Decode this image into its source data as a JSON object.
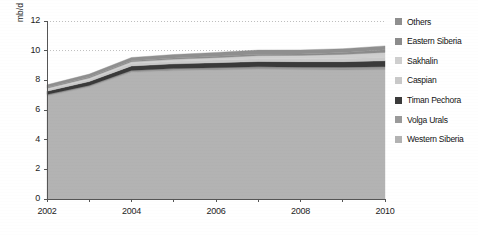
{
  "chart_data": {
    "type": "area",
    "stacked": true,
    "title": "",
    "xlabel": "",
    "ylabel": "mb/d",
    "x": [
      2002,
      2003,
      2004,
      2005,
      2006,
      2007,
      2008,
      2009,
      2010
    ],
    "xtick_labels": [
      "2002",
      "2004",
      "2006",
      "2008",
      "2010"
    ],
    "xtick_values": [
      2002,
      2004,
      2006,
      2008,
      2010
    ],
    "xlim": [
      2002,
      2010
    ],
    "ytick_labels": [
      "0",
      "2",
      "4",
      "6",
      "8",
      "10",
      "12"
    ],
    "ytick_values": [
      0,
      2,
      4,
      6,
      8,
      10,
      12
    ],
    "ylim": [
      0,
      12
    ],
    "grid": "horizontal-dotted",
    "gridlines_at": [
      10,
      12
    ],
    "legend_position": "right",
    "series": [
      {
        "name": "Western Siberia",
        "color": "#b3b3b3",
        "values": [
          6.95,
          7.55,
          8.55,
          8.65,
          8.7,
          8.75,
          8.72,
          8.7,
          8.72
        ]
      },
      {
        "name": "Volga Urals",
        "color": "#9a9a9a",
        "values": [
          0.1,
          0.11,
          0.12,
          0.14,
          0.15,
          0.16,
          0.17,
          0.18,
          0.2
        ]
      },
      {
        "name": "Timan Pechora",
        "color": "#3a3a3a",
        "values": [
          0.22,
          0.26,
          0.3,
          0.32,
          0.34,
          0.36,
          0.37,
          0.38,
          0.4
        ]
      },
      {
        "name": "Caspian",
        "color": "#c9c9c9",
        "values": [
          0.12,
          0.14,
          0.16,
          0.17,
          0.18,
          0.19,
          0.2,
          0.21,
          0.22
        ]
      },
      {
        "name": "Sakhalin",
        "color": "#cfcfcf",
        "values": [
          0.08,
          0.1,
          0.12,
          0.14,
          0.16,
          0.2,
          0.22,
          0.28,
          0.34
        ]
      },
      {
        "name": "Eastern Siberia",
        "color": "#8c8c8c",
        "values": [
          0.05,
          0.06,
          0.07,
          0.08,
          0.09,
          0.1,
          0.1,
          0.12,
          0.18
        ]
      },
      {
        "name": "Others",
        "color": "#8f8f8f",
        "values": [
          0.18,
          0.2,
          0.22,
          0.24,
          0.26,
          0.28,
          0.27,
          0.26,
          0.26
        ]
      }
    ],
    "legend": [
      {
        "label": "Others",
        "color": "#8f8f8f"
      },
      {
        "label": "Eastern Siberia",
        "color": "#8c8c8c"
      },
      {
        "label": "Sakhalin",
        "color": "#cfcfcf"
      },
      {
        "label": "Caspian",
        "color": "#c9c9c9"
      },
      {
        "label": "Timan Pechora",
        "color": "#3a3a3a"
      },
      {
        "label": "Volga Urals",
        "color": "#9a9a9a"
      },
      {
        "label": "Western Siberia",
        "color": "#b3b3b3"
      }
    ],
    "colors": {
      "axis": "#555555",
      "grid": "#c0c0c0",
      "text": "#1a1a1a",
      "background": "#ffffff"
    }
  }
}
